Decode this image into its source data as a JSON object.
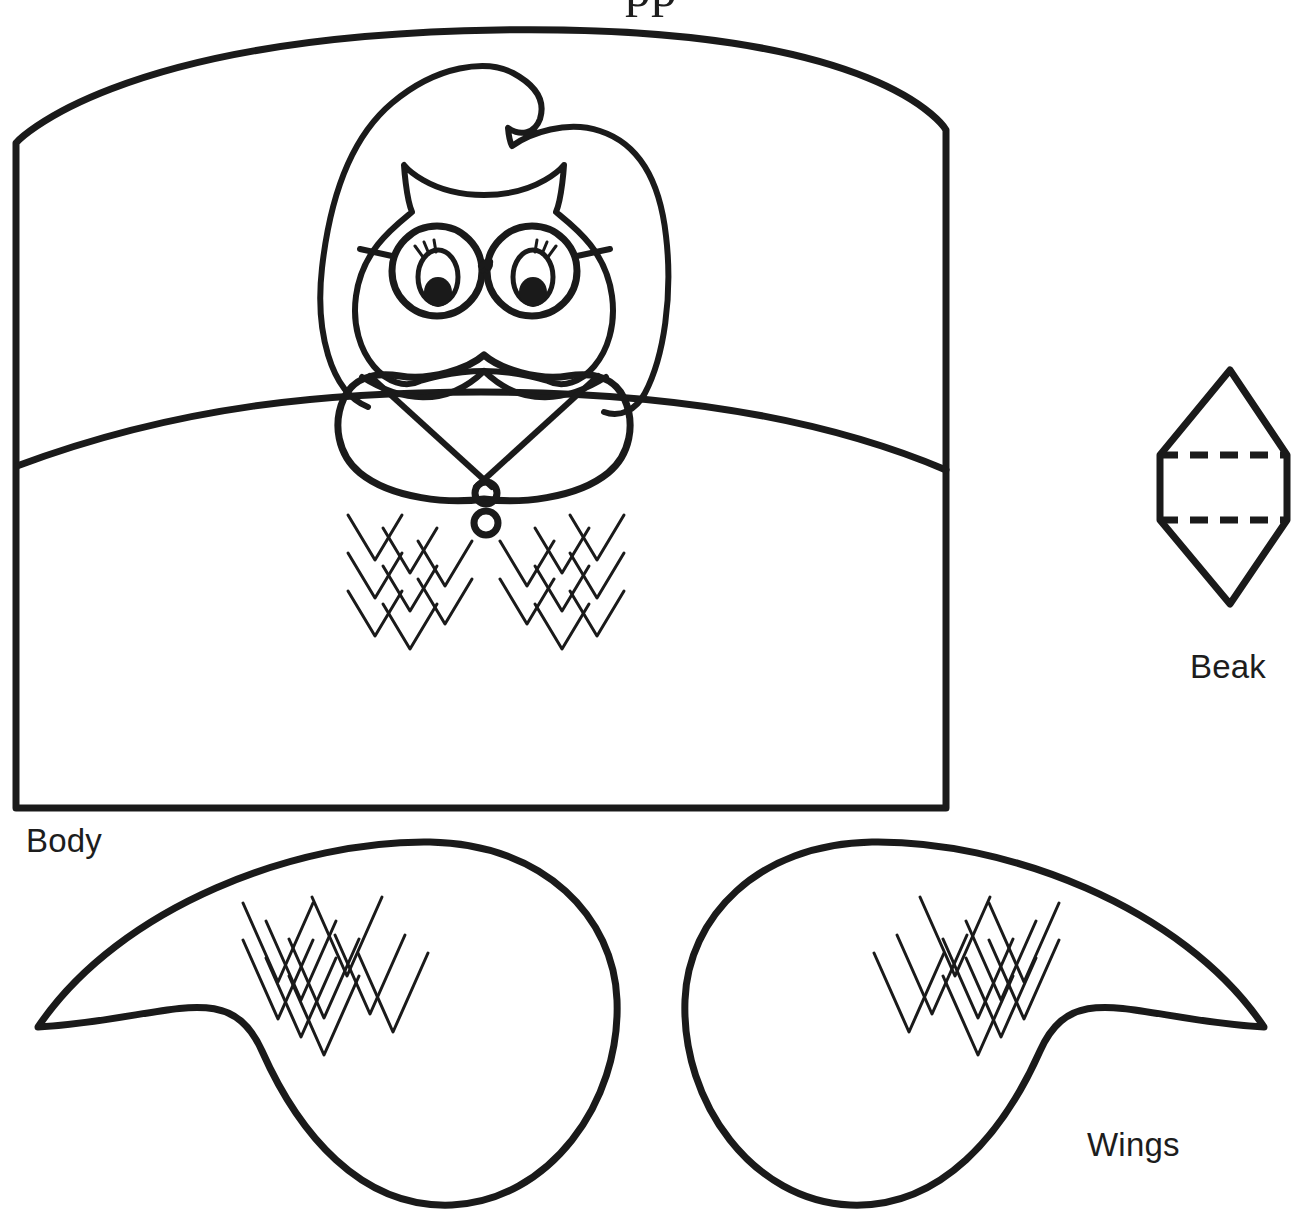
{
  "page": {
    "background_color": "#ffffff",
    "ink_color": "#1a1a1a",
    "width": 1302,
    "height": 1217,
    "document_type": "printable craft template"
  },
  "clipped_header": {
    "visible_fragment": "pp",
    "note": "bottom tips of two serif letters cropped by the top edge of the page"
  },
  "labels": {
    "body": "Body",
    "beak": "Beak",
    "wings": "Wings"
  },
  "pieces": [
    {
      "id": "body",
      "label": "Body",
      "label_position": "below-left",
      "shape": "rectangle with arched top",
      "features": [
        "curved chest line",
        "owl head with ear tufts",
        "bouffant curly hair",
        "round eyeglasses with two lenses and bridge",
        "two eyes with eyelashes and black pupils",
        "pointed beak",
        "shawl collar with crossed V",
        "two round buttons",
        "chevron feather pattern left",
        "chevron feather pattern right"
      ]
    },
    {
      "id": "beak",
      "label": "Beak",
      "label_position": "below",
      "shape": "elongated hexagon / diamond with straight sides",
      "features": [
        "upper dashed fold line",
        "lower dashed fold line"
      ]
    },
    {
      "id": "wings",
      "label": "Wings",
      "label_position": "below-right",
      "shape": "two mirrored teardrop wings meeting at the center",
      "features": [
        "left wing chevron feather pattern",
        "right wing chevron feather pattern",
        "narrow waist where the two wings touch"
      ]
    }
  ],
  "line_styles": {
    "outline_stroke_width": 7,
    "detail_stroke_width": 3,
    "dash_pattern": "18 12"
  }
}
